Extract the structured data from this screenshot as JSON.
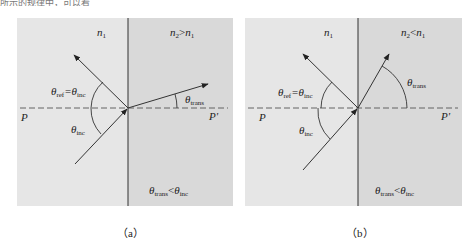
{
  "top_text": "所示的规律中，可以看",
  "panels": [
    {
      "id": "a",
      "caption": "（a）",
      "left_medium_label": "n",
      "left_medium_sub": "1",
      "right_medium_label": "n",
      "right_medium_sub": "2",
      "right_medium_rel": ">",
      "right_medium_rhs": "n",
      "right_medium_rhs_sub": "1",
      "reflect_label": "θ",
      "reflect_sub": "ref",
      "reflect_eq": "=θ",
      "reflect_eq_sub": "inc",
      "inc_label": "θ",
      "inc_sub": "inc",
      "trans_label": "θ",
      "trans_sub": "trans",
      "p_left": "P",
      "p_right": "P'",
      "bottom_lhs": "θ",
      "bottom_lhs_sub": "trans",
      "bottom_rel": "<",
      "bottom_rhs": "θ",
      "bottom_rhs_sub": "inc"
    },
    {
      "id": "b",
      "caption": "（b）",
      "left_medium_label": "n",
      "left_medium_sub": "1",
      "right_medium_label": "n",
      "right_medium_sub": "2",
      "right_medium_rel": "<",
      "right_medium_rhs": "n",
      "right_medium_rhs_sub": "1",
      "reflect_label": "θ",
      "reflect_sub": "ref",
      "reflect_eq": "=θ",
      "reflect_eq_sub": "inc",
      "inc_label": "θ",
      "inc_sub": "inc",
      "trans_label": "θ",
      "trans_sub": "trans",
      "p_left": "P",
      "p_right": "P'",
      "bottom_lhs": "θ",
      "bottom_lhs_sub": "trans",
      "bottom_rel": "<",
      "bottom_rhs": "θ",
      "bottom_rhs_sub": "inc"
    }
  ],
  "colors": {
    "medium1": "#e6e6e6",
    "medium2": "#d9d9d9",
    "line": "#333333",
    "dash": "#555555"
  }
}
